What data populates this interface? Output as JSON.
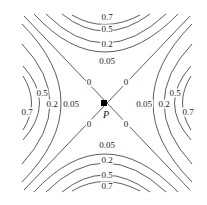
{
  "figure": {
    "type": "contour_plot",
    "point_label": "P",
    "contour_levels": [
      "0",
      "0.05",
      "0.2",
      "0.5",
      "0.7"
    ],
    "labels": {
      "top": [
        "0.7",
        "0.5",
        "0.2",
        "0.05"
      ],
      "bottom": [
        "0.05",
        "0.2",
        "0.5",
        "0.7"
      ],
      "left": [
        "0.05",
        "0.2",
        "0.5",
        "0.7"
      ],
      "right": [
        "0.05",
        "0.2",
        "0.5",
        "0.7"
      ],
      "zero": [
        "0",
        "0",
        "0",
        "0"
      ]
    }
  }
}
